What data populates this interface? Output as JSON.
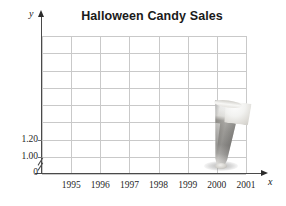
{
  "chart_data": {
    "type": "bar",
    "title": "Halloween Candy Sales",
    "xlabel": "x",
    "ylabel": "y",
    "grid": true,
    "legend": null,
    "categories": [
      "1995",
      "1996",
      "1997",
      "1998",
      "1999",
      "2000",
      "2001"
    ],
    "values": [
      null,
      null,
      null,
      null,
      null,
      1.68,
      null
    ],
    "y_tick_labels": [
      "1.00",
      "1.20"
    ],
    "y_tick_values": [
      1.0,
      1.2
    ],
    "origin_label": "0",
    "ylim": [
      1.0,
      1.68
    ],
    "axis_break": true,
    "marker_style": "pictograph-glass",
    "annotations": [
      {
        "category": "2000",
        "label": "",
        "pictograph": "glass-of-candy",
        "value": 1.68
      }
    ]
  },
  "chart": {
    "title": "Halloween Candy Sales",
    "axes": {
      "y_label": "y",
      "x_label": "x",
      "origin_label": "0"
    },
    "y_ticks": [
      {
        "label": "1.00",
        "value": 1.0
      },
      {
        "label": "1.20",
        "value": 1.2
      }
    ],
    "x_ticks": [
      {
        "label": "1995"
      },
      {
        "label": "1996"
      },
      {
        "label": "1997"
      },
      {
        "label": "1998"
      },
      {
        "label": "1999"
      },
      {
        "label": "2000"
      },
      {
        "label": "2001"
      }
    ],
    "colors": {
      "grid": "#c9c9c9",
      "axis": "#4a4a4a",
      "text": "#1f1f1f",
      "title": "#1a1a1a",
      "glass_light": "#efefef",
      "glass_dark": "#6d6b67"
    },
    "figure": {
      "name": "glass-pictograph",
      "category": "2000"
    }
  }
}
